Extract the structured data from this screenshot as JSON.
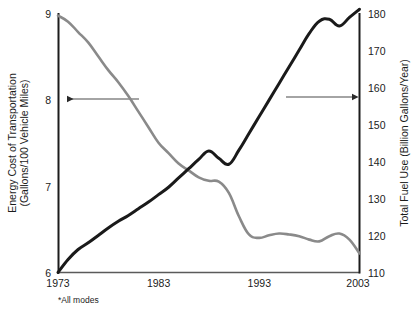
{
  "chart_data": {
    "type": "line",
    "title": "",
    "subtitle": "",
    "xlabel": "",
    "footnote": "*All modes",
    "grid": false,
    "legend": "none-arrows-indicate-axis",
    "xlim": [
      1973,
      2003
    ],
    "x_ticks": [
      "1973",
      "1983",
      "1993",
      "2003"
    ],
    "x_tick_values": [
      1973,
      1983,
      1993,
      2003
    ],
    "axes": [
      {
        "id": "left",
        "label": "Energy Cost of Transportation (Gallons/100 Vehicle Miles)",
        "label_line1": "Energy Cost of Transportation",
        "label_line2": "(Gallons/100 Vehicle Miles)",
        "ylim": [
          6,
          9
        ],
        "ticks": [
          "6",
          "7",
          "8",
          "9"
        ],
        "tick_values": [
          6,
          7,
          8,
          9
        ]
      },
      {
        "id": "right",
        "label": "Total Fuel Use (Billion Gallons/Year)",
        "ylim": [
          110,
          180
        ],
        "ticks": [
          "110",
          "120",
          "130",
          "140",
          "150",
          "160",
          "170",
          "180"
        ],
        "tick_values": [
          110,
          120,
          130,
          140,
          150,
          160,
          170,
          180
        ]
      }
    ],
    "x": [
      1973,
      1974,
      1975,
      1976,
      1977,
      1978,
      1979,
      1980,
      1981,
      1982,
      1983,
      1984,
      1985,
      1986,
      1987,
      1988,
      1989,
      1990,
      1991,
      1992,
      1993,
      1994,
      1995,
      1996,
      1997,
      1998,
      1999,
      2000,
      2001,
      2002,
      2003
    ],
    "series": [
      {
        "name": "Energy Cost of Transportation",
        "axis": "left",
        "units": "Gallons/100 Vehicle Miles",
        "color": "#8a8a8a",
        "width": 2.6,
        "values": [
          8.97,
          8.9,
          8.78,
          8.66,
          8.5,
          8.34,
          8.2,
          8.04,
          7.86,
          7.68,
          7.5,
          7.38,
          7.26,
          7.18,
          7.1,
          7.06,
          7.05,
          6.92,
          6.65,
          6.44,
          6.4,
          6.43,
          6.45,
          6.44,
          6.42,
          6.38,
          6.36,
          6.42,
          6.45,
          6.38,
          6.22
        ]
      },
      {
        "name": "Total Fuel Use",
        "axis": "right",
        "units": "Billion Gallons/Year",
        "color": "#1a1a1a",
        "width": 3.0,
        "values": [
          110.0,
          113.5,
          116.2,
          118.0,
          120.0,
          122.0,
          123.8,
          125.4,
          127.2,
          129.0,
          131.0,
          133.0,
          135.5,
          138.0,
          140.5,
          142.8,
          140.8,
          139.2,
          143.0,
          147.5,
          152.0,
          156.5,
          161.0,
          165.5,
          170.0,
          174.5,
          177.8,
          178.3,
          176.5,
          178.8,
          181.0
        ]
      }
    ],
    "annotations": [
      {
        "name": "left-axis-arrow",
        "type": "arrow",
        "direction": "left",
        "points_to_axis": "left",
        "at_value": 8,
        "color": "#3a3a3a"
      },
      {
        "name": "right-axis-arrow",
        "type": "arrow",
        "direction": "right",
        "points_to_axis": "right",
        "at_value": 160,
        "color": "#3a3a3a"
      }
    ]
  }
}
